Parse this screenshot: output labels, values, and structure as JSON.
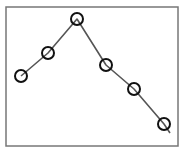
{
  "chart_data": {
    "type": "line",
    "title": "",
    "xlabel": "",
    "ylabel": "",
    "grid": false,
    "legend": null,
    "x": [
      1,
      2,
      3,
      4,
      5,
      6
    ],
    "series": [
      {
        "name": "series-1",
        "values": [
          5.0,
          7.0,
          10.0,
          6.0,
          4.0,
          1.0
        ],
        "marker": "hollow-circle",
        "line_color": "#555555",
        "marker_color": "#111111"
      }
    ],
    "pixel_points": [
      [
        21,
        76
      ],
      [
        48,
        53
      ],
      [
        77,
        19
      ],
      [
        106,
        65
      ],
      [
        134,
        89
      ],
      [
        164,
        124
      ]
    ],
    "line_tail": [
      170,
      133
    ],
    "frame": {
      "left": 6,
      "top": 7,
      "right": 178,
      "bottom": 146,
      "color": "#777777"
    },
    "note": "Top title text is cropped off; only descenders visible"
  }
}
